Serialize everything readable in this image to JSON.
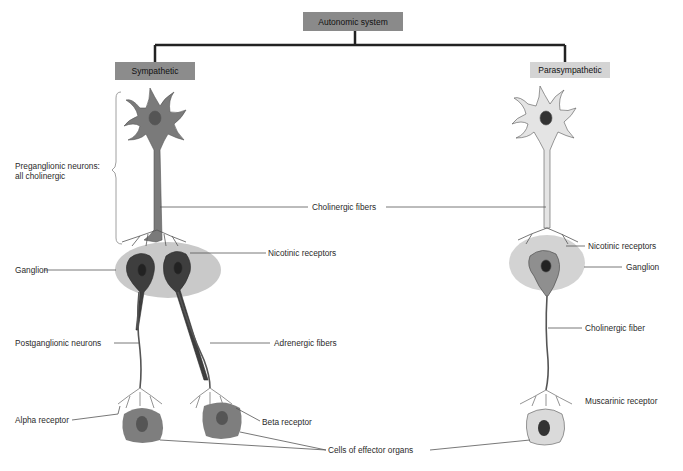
{
  "title": "Autonomic system",
  "branches": {
    "left": "Sympathetic",
    "right": "Parasympathetic"
  },
  "labels": {
    "preganglionic": "Preganglionic neurons:",
    "preganglionic_2": "all cholinergic",
    "cholinergic_fibers": "Cholinergic fibers",
    "nicotinic_left": "Nicotinic receptors",
    "nicotinic_right": "Nicotinic receptors",
    "ganglion_left": "Ganglion",
    "ganglion_right": "Ganglion",
    "postganglionic": "Postganglionic neurons",
    "adrenergic": "Adrenergic fibers",
    "cholinergic_fiber": "Cholinergic fiber",
    "alpha": "Alpha receptor",
    "beta": "Beta receptor",
    "muscarinic": "Muscarinic receptor",
    "effector": "Cells of effector organs"
  },
  "colors": {
    "title_box": "#8a8a8a",
    "sympathetic_box": "#8c8c8c",
    "parasympathetic_box": "#d4d4d4",
    "symp_neuron": "#7a7a7a",
    "para_neuron": "#e2e2e2",
    "ganglion": "#c9c9c9",
    "nucleus": "#4a4a4a"
  }
}
